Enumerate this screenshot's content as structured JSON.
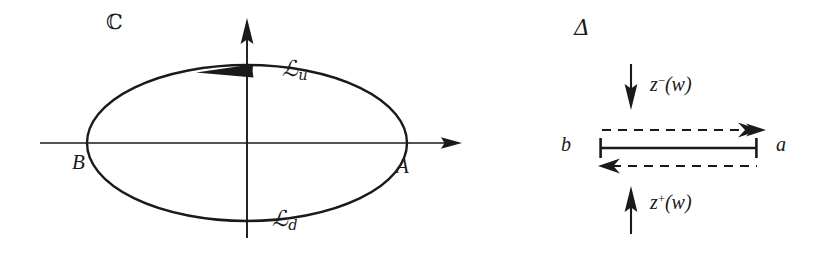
{
  "figure": {
    "background_color": "#ffffff",
    "ink_color": "#1a1a1a",
    "width": 828,
    "height": 253
  },
  "left_panel": {
    "name": "complex-plane-with-contour",
    "plane_label": "ℂ",
    "axes": {
      "real_axis_label": "",
      "imaginary_axis_label": "",
      "origin": [
        247,
        143
      ],
      "real_axis_y": 143,
      "imaginary_axis_x": 247,
      "real_axis_extent": [
        40,
        462
      ],
      "imaginary_axis_extent": [
        20,
        238
      ]
    },
    "contour": {
      "type": "ellipse",
      "center": [
        247,
        143
      ],
      "semi_axis_x": 160,
      "semi_axis_y": 78,
      "orientation_arrow": "leftward at top crossing of imaginary axis",
      "upper_branch_label": "ℒ",
      "upper_branch_subscript": "u",
      "lower_branch_label": "ℒ",
      "lower_branch_subscript": "d"
    },
    "vertices": {
      "right_label": "A",
      "left_label": "B"
    }
  },
  "right_panel": {
    "name": "delta-segment-diagram",
    "region_label": "Δ",
    "segment": {
      "left_endpoint_label": "b",
      "right_endpoint_label": "a",
      "x_start": 600,
      "x_end": 757,
      "y": 148
    },
    "top_dashed_arrow": {
      "direction": "right",
      "y": 130
    },
    "bottom_dashed_arrow": {
      "direction": "left",
      "y": 166
    },
    "upper_flow": {
      "arrow_direction": "down",
      "label_base": "z",
      "label_superscript": "−",
      "label_argument": "(w)",
      "label_text": "z−(w)"
    },
    "lower_flow": {
      "arrow_direction": "up",
      "label_base": "z",
      "label_superscript": "+",
      "label_argument": "(w)",
      "label_text": "z+(w)"
    }
  }
}
